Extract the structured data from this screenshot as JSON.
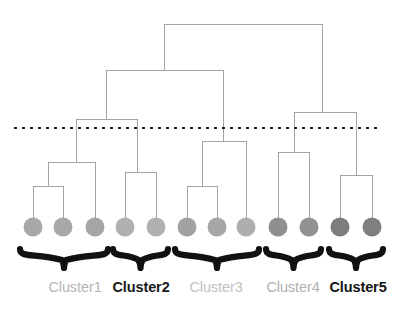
{
  "figure": {
    "type": "dendrogram",
    "title": "",
    "width": 409,
    "height": 315,
    "background": "#ffffff",
    "link_color": "#9a9a9a",
    "link_width": 0.9,
    "cut_line": {
      "label": "cut-threshold",
      "y": 128,
      "x_start": 14,
      "x_end": 377,
      "color": "#1b1b1b",
      "style": "dotted",
      "dash": "3 5",
      "width": 2.1
    },
    "brace_color": "#111111",
    "leaf_radius": 9.5
  },
  "chart_data": {
    "type": "dendrogram",
    "xlabel": "",
    "ylabel": "",
    "n_leaves": 12,
    "n_clusters": 5,
    "leaves": [
      {
        "id": "L1",
        "x": 33,
        "y": 227,
        "color": "#a8a8a8",
        "cluster": "Cluster1"
      },
      {
        "id": "L2",
        "x": 63,
        "y": 227,
        "color": "#a8a8a8",
        "cluster": "Cluster1"
      },
      {
        "id": "L3",
        "x": 95,
        "y": 227,
        "color": "#a5a5a5",
        "cluster": "Cluster1"
      },
      {
        "id": "L4",
        "x": 125,
        "y": 227,
        "color": "#b0b0b0",
        "cluster": "Cluster2"
      },
      {
        "id": "L5",
        "x": 156,
        "y": 227,
        "color": "#b0b0b0",
        "cluster": "Cluster2"
      },
      {
        "id": "L6",
        "x": 187,
        "y": 227,
        "color": "#a2a2a2",
        "cluster": "Cluster3"
      },
      {
        "id": "L7",
        "x": 217,
        "y": 227,
        "color": "#a6a6a6",
        "cluster": "Cluster3"
      },
      {
        "id": "L8",
        "x": 246,
        "y": 227,
        "color": "#aeaeae",
        "cluster": "Cluster3"
      },
      {
        "id": "L9",
        "x": 278,
        "y": 227,
        "color": "#8f8f8f",
        "cluster": "Cluster4"
      },
      {
        "id": "L10",
        "x": 309,
        "y": 227,
        "color": "#919191",
        "cluster": "Cluster4"
      },
      {
        "id": "L11",
        "x": 340,
        "y": 227,
        "color": "#7d7d7d",
        "cluster": "Cluster5"
      },
      {
        "id": "L12",
        "x": 372,
        "y": 227,
        "color": "#7f7f7f",
        "cluster": "Cluster5"
      }
    ],
    "merges": [
      {
        "id": "M1",
        "label": "merge-L1-L2",
        "x_left": 33,
        "x_right": 63,
        "y": 186,
        "x_center": 48
      },
      {
        "id": "M2",
        "label": "merge-M1-L3",
        "x_left": 48,
        "x_right": 95,
        "y": 162,
        "x_center": 76
      },
      {
        "id": "M3",
        "label": "merge-L4-L5",
        "x_left": 125,
        "x_right": 156,
        "y": 172,
        "x_center": 137
      },
      {
        "id": "M4",
        "label": "merge-L6-L7",
        "x_left": 187,
        "x_right": 217,
        "y": 186,
        "x_center": 202
      },
      {
        "id": "M5",
        "label": "merge-M4-L8",
        "x_left": 202,
        "x_right": 246,
        "y": 141,
        "x_center": 223
      },
      {
        "id": "M6",
        "label": "merge-L9-L10",
        "x_left": 278,
        "x_right": 309,
        "y": 152,
        "x_center": 294
      },
      {
        "id": "M7",
        "label": "merge-L11-L12",
        "x_left": 340,
        "x_right": 372,
        "y": 175,
        "x_center": 356
      },
      {
        "id": "M8",
        "label": "merge-cluster1-2",
        "x_left": 76,
        "x_right": 137,
        "y": 119,
        "x_center": 106
      },
      {
        "id": "M9",
        "label": "merge-cluster4-5",
        "x_left": 294,
        "x_right": 356,
        "y": 112,
        "x_center": 322
      },
      {
        "id": "M10",
        "label": "merge-left-branch",
        "x_left": 106,
        "x_right": 223,
        "y": 70,
        "x_center": 164
      },
      {
        "id": "M11",
        "label": "merge-root",
        "x_left": 164,
        "x_right": 322,
        "y": 24,
        "x_center": 243
      }
    ],
    "clusters": [
      {
        "name": "Cluster1",
        "label_x": 75,
        "label_color": "#b5b5b5",
        "weight": "400",
        "brace_left": 20,
        "brace_right": 108,
        "members": [
          "L1",
          "L2",
          "L3"
        ]
      },
      {
        "name": "Cluster2",
        "label_x": 141,
        "label_color": "#1a1a1a",
        "weight": "700",
        "brace_left": 113,
        "brace_right": 168,
        "members": [
          "L4",
          "L5"
        ]
      },
      {
        "name": "Cluster3",
        "label_x": 216,
        "label_color": "#c2c2c2",
        "weight": "400",
        "brace_left": 175,
        "brace_right": 259,
        "members": [
          "L6",
          "L7",
          "L8"
        ]
      },
      {
        "name": "Cluster4",
        "label_x": 293,
        "label_color": "#b0b0b0",
        "weight": "400",
        "brace_left": 266,
        "brace_right": 321,
        "members": [
          "L9",
          "L10"
        ]
      },
      {
        "name": "Cluster5",
        "label_x": 358,
        "label_color": "#141414",
        "weight": "700",
        "brace_left": 329,
        "brace_right": 383,
        "members": [
          "L11",
          "L12"
        ]
      }
    ],
    "brace_y_top": 249,
    "brace_y_tip": 268,
    "label_y": 279
  }
}
